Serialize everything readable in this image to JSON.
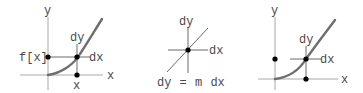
{
  "panels": [
    {
      "id": "panel-1",
      "labels": {
        "y_axis": "y",
        "x_axis": "x",
        "fx": "f[x]",
        "dy": "dy",
        "dx": "dx",
        "x_point": "x"
      }
    },
    {
      "id": "panel-2",
      "labels": {
        "dy": "dy",
        "dx": "dx",
        "equation": "dy = m dx"
      }
    },
    {
      "id": "panel-3",
      "labels": {
        "y_axis": "y",
        "x_axis": "x",
        "dy": "dy",
        "dx": "dx"
      }
    }
  ],
  "colors": {
    "axis": "#a8a8a8",
    "curve": "#6e6e6e",
    "dot": "#000000",
    "text": "#4a4a4a"
  }
}
